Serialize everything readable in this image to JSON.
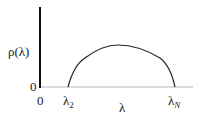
{
  "diagram": {
    "title": "",
    "y_label": "ρ(λ)",
    "x_label": "λ",
    "y_origin_label": "0",
    "x_origin_label": "0",
    "x_markers": [
      {
        "base": "λ",
        "subscript": "2"
      },
      {
        "base": "λ",
        "subscript": "N"
      }
    ],
    "curve": {
      "shape": "semicircle-like density",
      "support_start": "λ₂",
      "support_end": "λN"
    },
    "colors": {
      "axis": "#111111",
      "curve": "#222222",
      "baseline": "#bbbbbb"
    }
  }
}
